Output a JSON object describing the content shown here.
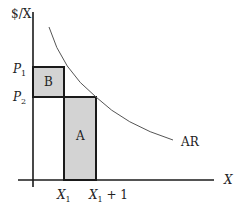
{
  "diagram": {
    "y_axis_label": "$/X",
    "x_axis_label": "X",
    "price_labels": {
      "p1": {
        "base": "P",
        "sub": "1"
      },
      "p2": {
        "base": "P",
        "sub": "2"
      }
    },
    "quantity_labels": {
      "x1": {
        "base": "X",
        "sub": "1",
        "suffix": ""
      },
      "x1_plus_1": {
        "base": "X",
        "sub": "1",
        "suffix": " + 1"
      }
    },
    "regions": {
      "a": "A",
      "b": "B"
    },
    "curve_label": "AR",
    "colors": {
      "shade": "#d3d3d3",
      "line": "#1a1a1a",
      "curve": "#555555"
    }
  }
}
